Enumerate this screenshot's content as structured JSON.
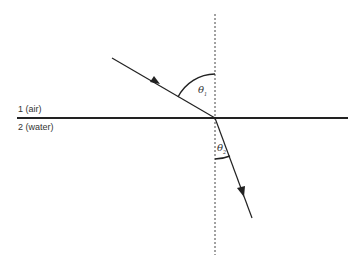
{
  "media": {
    "medium1_label": "1 (air)",
    "medium2_label": "2 (water)"
  },
  "angles": {
    "incident_symbol": "θ",
    "incident_sub": "1",
    "refracted_symbol": "θ",
    "refracted_sub": "2"
  },
  "colors": {
    "line": "#222222",
    "text": "#333333"
  }
}
